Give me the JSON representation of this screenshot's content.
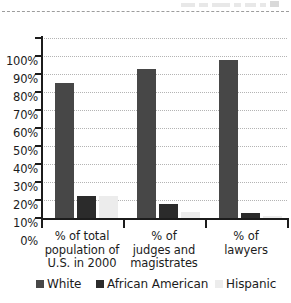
{
  "chart_data": {
    "type": "bar",
    "title": "",
    "subtitle": "",
    "xlabel": "",
    "ylabel": "",
    "ylim": [
      0,
      100
    ],
    "y_unit": "%",
    "grid": true,
    "legend_position": "bottom",
    "categories": [
      "% of total\npopulation of\nU.S. in 2000",
      "% of\njudges and\nmagistrates",
      "% of\nlawyers"
    ],
    "category_lines": [
      [
        "% of total",
        "population of",
        "U.S. in 2000"
      ],
      [
        "% of",
        "judges and",
        "magistrates"
      ],
      [
        "% of",
        "lawyers"
      ]
    ],
    "series": [
      {
        "name": "White",
        "color": "#474747",
        "values": [
          75,
          83,
          88
        ]
      },
      {
        "name": "African American",
        "color": "#2b2b2b",
        "values": [
          12,
          8,
          3
        ]
      },
      {
        "name": "Hispanic",
        "color": "#ececec",
        "values": [
          12.5,
          3.5,
          1
        ]
      }
    ],
    "y_ticks": [
      {
        "value": 100,
        "label": "100%"
      },
      {
        "value": 90,
        "label": "90%"
      },
      {
        "value": 80,
        "label": "80%"
      },
      {
        "value": 70,
        "label": "70%"
      },
      {
        "value": 60,
        "label": "60%"
      },
      {
        "value": 50,
        "label": "50%"
      },
      {
        "value": 40,
        "label": "40%"
      },
      {
        "value": 30,
        "label": "30%"
      },
      {
        "value": 20,
        "label": "20%"
      },
      {
        "value": 10,
        "label": "10%"
      },
      {
        "value": 0,
        "label": "0%"
      }
    ]
  },
  "legend": {
    "items": [
      {
        "label": "White",
        "color": "#474747"
      },
      {
        "label": "African American",
        "color": "#2b2b2b"
      },
      {
        "label": "Hispanic",
        "color": "#ececec"
      }
    ]
  }
}
